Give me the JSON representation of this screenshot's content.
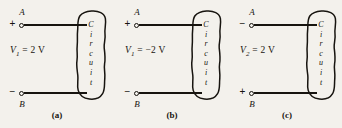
{
  "figure": {
    "type": "circuit-diagram-figure",
    "ink_color": "#17140f",
    "background_color": "#f3f1ec",
    "panels": [
      {
        "caption": "(a)",
        "top_terminal": {
          "sign": "+",
          "label": "A"
        },
        "bottom_terminal": {
          "sign": "−",
          "label": "B"
        },
        "voltage": {
          "symbol": "V",
          "subscript": "1",
          "equals": "=",
          "value": "2",
          "unit": "V",
          "full": "V1 = 2 V"
        },
        "block": {
          "letters": [
            "C",
            "i",
            "r",
            "c",
            "u",
            "i",
            "t"
          ],
          "label": "Circuit"
        }
      },
      {
        "caption": "(b)",
        "top_terminal": {
          "sign": "+",
          "label": "A"
        },
        "bottom_terminal": {
          "sign": "−",
          "label": "B"
        },
        "voltage": {
          "symbol": "V",
          "subscript": "1",
          "equals": "=",
          "value": "−2",
          "unit": "V",
          "full": "V1 = −2 V"
        },
        "block": {
          "letters": [
            "C",
            "i",
            "r",
            "c",
            "u",
            "i",
            "t"
          ],
          "label": "Circuit"
        }
      },
      {
        "caption": "(c)",
        "top_terminal": {
          "sign": "−",
          "label": "A"
        },
        "bottom_terminal": {
          "sign": "+",
          "label": "B"
        },
        "voltage": {
          "symbol": "V",
          "subscript": "2",
          "equals": "=",
          "value": "2",
          "unit": "V",
          "full": "V2 = 2 V"
        },
        "block": {
          "letters": [
            "C",
            "i",
            "r",
            "c",
            "u",
            "i",
            "t"
          ],
          "label": "Circuit"
        }
      }
    ]
  }
}
